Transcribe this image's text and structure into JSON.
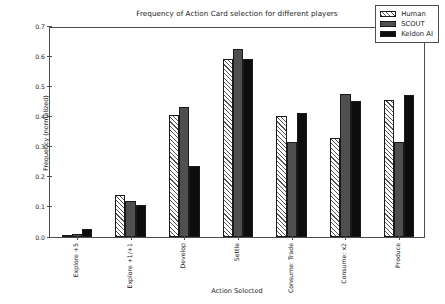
{
  "chart_data": {
    "type": "bar",
    "title": "Frequency of Action Card selection for different players",
    "xlabel": "Action Selected",
    "ylabel": "Frequency (normalized)",
    "ylim": [
      0.0,
      0.7
    ],
    "yticks": [
      "0.0",
      "0.1",
      "0.2",
      "0.3",
      "0.4",
      "0.5",
      "0.6",
      "0.7"
    ],
    "ytick_values": [
      0.0,
      0.1,
      0.2,
      0.3,
      0.4,
      0.5,
      0.6,
      0.7
    ],
    "grid": false,
    "legend_position": "upper right",
    "categories": [
      "Explore +5",
      "Explore +1/+1",
      "Develop",
      "Settle",
      "Consume: Trade",
      "Consume: x2",
      "Produce"
    ],
    "series": [
      {
        "name": "Human",
        "color": "#ffffff",
        "hatch": "///",
        "values": [
          0.005,
          0.14,
          0.405,
          0.59,
          0.4,
          0.33,
          0.455
        ]
      },
      {
        "name": "SCOUT",
        "color": "#4f4f4f",
        "hatch": "",
        "values": [
          0.01,
          0.12,
          0.43,
          0.625,
          0.315,
          0.475,
          0.315
        ]
      },
      {
        "name": "Keldon AI",
        "color": "#0d0d0d",
        "hatch": "",
        "values": [
          0.025,
          0.105,
          0.235,
          0.59,
          0.41,
          0.45,
          0.47
        ]
      }
    ]
  }
}
